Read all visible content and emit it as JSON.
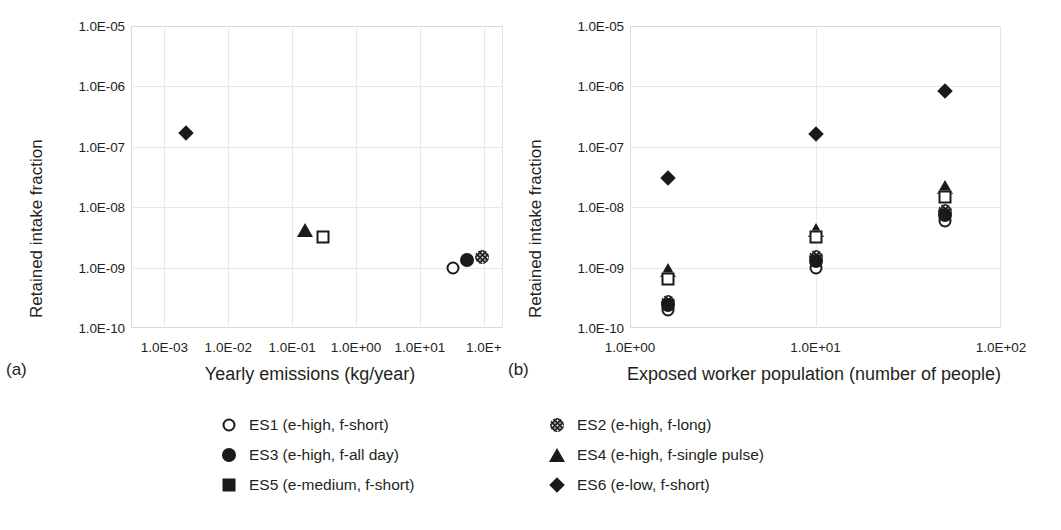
{
  "figure": {
    "panel_a_letter": "(a)",
    "panel_b_letter": "(b)"
  },
  "chart_data": [
    {
      "type": "scatter",
      "panel": "(a)",
      "title": "",
      "xlabel": "Yearly emissions (kg/year)",
      "ylabel": "Retained intake fraction",
      "xscale": "log",
      "yscale": "log",
      "xlim": [
        0.0003,
        200
      ],
      "ylim": [
        1e-10,
        1e-05
      ],
      "grid": true,
      "legend_position": "below",
      "xticklabels": [
        "1.0E-03",
        "1.0E-02",
        "1.0E-01",
        "1.0E+00",
        "1.0E+01",
        "1.0E+"
      ],
      "xtickvalues": [
        0.001,
        0.01,
        0.1,
        1,
        10,
        100
      ],
      "yticklabels": [
        "1.0E-05",
        "1.0E-06",
        "1.0E-07",
        "1.0E-08",
        "1.0E-09",
        "1.0E-10"
      ],
      "ytickvalues": [
        1e-05,
        1e-06,
        1e-07,
        1e-08,
        1e-09,
        1e-10
      ],
      "series": [
        {
          "name": "ES1 (e-high, f-short)",
          "marker": "circle-open",
          "x": [
            33.0
          ],
          "y": [
            1e-09
          ]
        },
        {
          "name": "ES2 (e-high, f-long)",
          "marker": "circle-dot",
          "x": [
            95.0
          ],
          "y": [
            1.5e-09
          ]
        },
        {
          "name": "ES3 (e-high, f-all day)",
          "marker": "circle-fill",
          "x": [
            55.0
          ],
          "y": [
            1.35e-09
          ]
        },
        {
          "name": "ES4 (e-high, f-single pulse)",
          "marker": "triangle",
          "x": [
            0.16
          ],
          "y": [
            4.2e-09
          ]
        },
        {
          "name": "ES5 (e-medium, f-short)",
          "marker": "square-open",
          "x": [
            0.3
          ],
          "y": [
            3.2e-09
          ]
        },
        {
          "name": "ES6 (e-low, f-short)",
          "marker": "diamond",
          "x": [
            0.0022
          ],
          "y": [
            1.7e-07
          ]
        }
      ]
    },
    {
      "type": "scatter",
      "panel": "(b)",
      "title": "",
      "xlabel": "Exposed worker population (number of people)",
      "ylabel": "Retained intake fraction",
      "xscale": "log",
      "yscale": "log",
      "xlim": [
        1,
        100
      ],
      "ylim": [
        1e-10,
        1e-05
      ],
      "grid": true,
      "legend_position": "below",
      "xticklabels": [
        "1.0E+00",
        "1.0E+01",
        "1.0E+02"
      ],
      "xtickvalues": [
        1,
        10,
        100
      ],
      "yticklabels": [
        "1.0E-05",
        "1.0E-06",
        "1.0E-07",
        "1.0E-08",
        "1.0E-09",
        "1.0E-10"
      ],
      "ytickvalues": [
        1e-05,
        1e-06,
        1e-07,
        1e-08,
        1e-09,
        1e-10
      ],
      "series": [
        {
          "name": "ES1 (e-high, f-short)",
          "marker": "circle-open",
          "x": [
            1.6,
            10.0,
            50.0
          ],
          "y": [
            2e-10,
            1e-09,
            6e-09
          ]
        },
        {
          "name": "ES2 (e-high, f-long)",
          "marker": "circle-dot",
          "x": [
            1.6,
            10.0,
            50.0
          ],
          "y": [
            2.7e-10,
            1.5e-09,
            8.5e-09
          ]
        },
        {
          "name": "ES3 (e-high, f-all day)",
          "marker": "circle-fill",
          "x": [
            1.6,
            10.0,
            50.0
          ],
          "y": [
            2.4e-10,
            1.3e-09,
            7.5e-09
          ]
        },
        {
          "name": "ES4 (e-high, f-single pulse)",
          "marker": "triangle",
          "x": [
            1.6,
            10.0,
            50.0
          ],
          "y": [
            9e-10,
            4.2e-09,
            2.2e-08
          ]
        },
        {
          "name": "ES5 (e-medium, f-short)",
          "marker": "square-open",
          "x": [
            1.6,
            10.0,
            50.0
          ],
          "y": [
            6.5e-10,
            3.2e-09,
            1.5e-08
          ]
        },
        {
          "name": "ES6 (e-low, f-short)",
          "marker": "diamond",
          "x": [
            1.6,
            10.0,
            50.0
          ],
          "y": [
            3e-08,
            1.6e-07,
            8.5e-07
          ]
        }
      ]
    }
  ],
  "legend_a": {
    "items": [
      {
        "marker": "circle-open",
        "label": "ES1 (e-high, f-short)"
      },
      {
        "marker": "circle-fill",
        "label": "ES3 (e-high, f-all day)"
      },
      {
        "marker": "square-fill",
        "label": "ES5 (e-medium, f-short)"
      }
    ]
  },
  "legend_b": {
    "items": [
      {
        "marker": "circle-dot",
        "label": "ES2 (e-high, f-long)"
      },
      {
        "marker": "triangle",
        "label": "ES4 (e-high, f-single pulse)"
      },
      {
        "marker": "diamond",
        "label": "ES6 (e-low, f-short)"
      }
    ]
  }
}
